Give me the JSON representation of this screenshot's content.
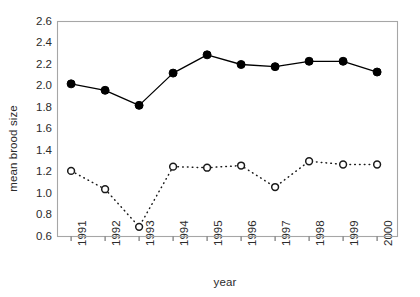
{
  "chart_data": {
    "type": "line",
    "title": "",
    "xlabel": "year",
    "ylabel": "mean brood size",
    "categories": [
      "1991",
      "1992",
      "1993",
      "1994",
      "1995",
      "1996",
      "1997",
      "1998",
      "1999",
      "2000"
    ],
    "x": [
      1991,
      1992,
      1993,
      1994,
      1995,
      1996,
      1997,
      1998,
      1999,
      2000
    ],
    "xlim": [
      1990.6,
      2000.6
    ],
    "ylim": [
      0.6,
      2.6
    ],
    "ytick_labels": [
      "0.6",
      "0.8",
      "1.0",
      "1.2",
      "1.4",
      "1.6",
      "1.8",
      "2.0",
      "2.2",
      "2.4",
      "2.6"
    ],
    "ytick_values": [
      0.6,
      0.8,
      1.0,
      1.2,
      1.4,
      1.6,
      1.8,
      2.0,
      2.2,
      2.4,
      2.6
    ],
    "grid": false,
    "legend": "none",
    "series": [
      {
        "name": "filled-circle-series",
        "marker": "filled-circle",
        "linestyle": "solid",
        "color": "#000000",
        "values": [
          2.02,
          1.96,
          1.82,
          2.12,
          2.29,
          2.2,
          2.18,
          2.23,
          2.23,
          2.13
        ]
      },
      {
        "name": "open-circle-series",
        "marker": "open-circle",
        "linestyle": "dotted",
        "color": "#1a1a1a",
        "values": [
          1.21,
          1.04,
          0.69,
          1.25,
          1.24,
          1.26,
          1.06,
          1.3,
          1.27,
          1.27
        ]
      }
    ]
  },
  "axes": {
    "frame_color": "#a6a6a6",
    "tick_color": "#6b6b6b",
    "label_color": "#2b2b2b"
  }
}
